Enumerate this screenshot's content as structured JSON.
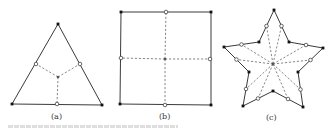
{
  "figure": {
    "panels": [
      {
        "id": "a",
        "label": "(a)",
        "shape": "triangle",
        "vertices": [
          [
            58,
            24
          ],
          [
            102,
            105
          ],
          [
            12,
            104
          ]
        ],
        "edge_midpoints": [
          [
            80,
            64
          ],
          [
            57,
            104
          ],
          [
            36,
            64
          ]
        ],
        "center": [
          58,
          77
        ]
      },
      {
        "id": "b",
        "label": "(b)",
        "shape": "square",
        "vertices": [
          [
            121,
            12
          ],
          [
            211,
            12
          ],
          [
            211,
            105
          ],
          [
            120,
            104
          ]
        ],
        "edge_midpoints": [
          [
            166,
            12
          ],
          [
            210,
            59
          ],
          [
            165,
            105
          ],
          [
            121,
            58
          ]
        ],
        "center": [
          165,
          59
        ]
      },
      {
        "id": "c",
        "label": "(c)",
        "shape": "star",
        "vertices": [
          [
            274,
            10
          ],
          [
            289,
            42
          ],
          [
            323,
            48
          ],
          [
            298,
            72
          ],
          [
            303,
            107
          ],
          [
            273,
            91
          ],
          [
            243,
            106
          ],
          [
            249,
            72
          ],
          [
            224,
            47
          ],
          [
            259,
            42
          ]
        ],
        "center": [
          273,
          64
        ]
      }
    ],
    "caption_visible": false
  },
  "colors": {
    "edge": "#3a3a3a",
    "dash": "#6a6a6a",
    "vertex": "#111111",
    "background": "#ffffff"
  }
}
